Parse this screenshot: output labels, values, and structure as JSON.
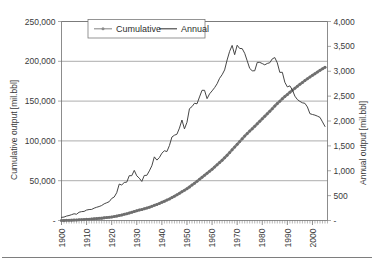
{
  "chart_data": {
    "type": "line",
    "title": "",
    "xlabel": "",
    "ylabel": "Cumulative output [mil.bbl]",
    "y2label": "Annual output [mil.bbl]",
    "xlim": [
      1900,
      2006
    ],
    "ylim": [
      0,
      250000
    ],
    "y2lim": [
      0,
      4000
    ],
    "grid": "horizontal",
    "legend_position": "top-left-inside",
    "x_tick_labels": [
      "1900",
      "1910",
      "1920",
      "1930",
      "1940",
      "1950",
      "1960",
      "1970",
      "1980",
      "1990",
      "2000"
    ],
    "x_ticks": [
      1900,
      1910,
      1920,
      1930,
      1940,
      1950,
      1960,
      1970,
      1980,
      1990,
      2000
    ],
    "x_minor_tick_interval": 1,
    "y_tick_labels": [
      "-",
      "50,000",
      "100,000",
      "150,000",
      "200,000",
      "250,000"
    ],
    "y_ticks": [
      0,
      50000,
      100000,
      150000,
      200000,
      250000
    ],
    "y2_tick_labels": [
      "-",
      "500",
      "1,000",
      "1,500",
      "2,000",
      "2,500",
      "3,000",
      "3,500",
      "4,000"
    ],
    "y2_ticks": [
      0,
      500,
      1000,
      1500,
      2000,
      2500,
      3000,
      3500,
      4000
    ],
    "x": [
      1900,
      1901,
      1902,
      1903,
      1904,
      1905,
      1906,
      1907,
      1908,
      1909,
      1910,
      1911,
      1912,
      1913,
      1914,
      1915,
      1916,
      1917,
      1918,
      1919,
      1920,
      1921,
      1922,
      1923,
      1924,
      1925,
      1926,
      1927,
      1928,
      1929,
      1930,
      1931,
      1932,
      1933,
      1934,
      1935,
      1936,
      1937,
      1938,
      1939,
      1940,
      1941,
      1942,
      1943,
      1944,
      1945,
      1946,
      1947,
      1948,
      1949,
      1950,
      1951,
      1952,
      1953,
      1954,
      1955,
      1956,
      1957,
      1958,
      1959,
      1960,
      1961,
      1962,
      1963,
      1964,
      1965,
      1966,
      1967,
      1968,
      1969,
      1970,
      1971,
      1972,
      1973,
      1974,
      1975,
      1976,
      1977,
      1978,
      1979,
      1980,
      1981,
      1982,
      1983,
      1984,
      1985,
      1986,
      1987,
      1988,
      1989,
      1990,
      1991,
      1992,
      1993,
      1994,
      1995,
      1996,
      1997,
      1998,
      1999,
      2000,
      2001,
      2002,
      2003,
      2004,
      2005
    ],
    "series": [
      {
        "name": "Annual",
        "axis": "right",
        "units": "mil.bbl",
        "color": "#3c3c3c",
        "marker": "none",
        "values": [
          63,
          69,
          89,
          100,
          117,
          135,
          126,
          166,
          178,
          183,
          210,
          220,
          223,
          248,
          266,
          281,
          301,
          335,
          356,
          378,
          443,
          472,
          558,
          732,
          714,
          764,
          771,
          901,
          901,
          1007,
          898,
          851,
          785,
          906,
          908,
          997,
          1100,
          1279,
          1214,
          1265,
          1353,
          1402,
          1386,
          1506,
          1678,
          1714,
          1734,
          1857,
          2020,
          1842,
          1974,
          2248,
          2289,
          2357,
          2345,
          2484,
          2617,
          2617,
          2449,
          2545,
          2605,
          2670,
          2748,
          2858,
          2930,
          3027,
          3227,
          3400,
          3519,
          3333,
          3523,
          3458,
          3455,
          3361,
          3210,
          3057,
          3009,
          3009,
          3178,
          3178,
          3155,
          3129,
          3157,
          3171,
          3249,
          3275,
          3168,
          2977,
          2979,
          2779,
          2685,
          2707,
          2625,
          2499,
          2431,
          2394,
          2366,
          2355,
          2282,
          2147,
          2131,
          2118,
          2097,
          2073,
          1983,
          1890
        ]
      },
      {
        "name": "Cumulative",
        "axis": "left",
        "units": "mil.bbl",
        "color": "#8c8c8c",
        "marker": "dot",
        "values": [
          63,
          132,
          221,
          321,
          438,
          573,
          699,
          865,
          1043,
          1226,
          1436,
          1656,
          1879,
          2127,
          2393,
          2674,
          2975,
          3310,
          3666,
          4044,
          4487,
          4959,
          5517,
          6249,
          6963,
          7727,
          8498,
          9399,
          10300,
          11307,
          12205,
          13056,
          13841,
          14747,
          15655,
          16652,
          17752,
          19031,
          20245,
          21510,
          22863,
          24265,
          25651,
          27157,
          28835,
          30549,
          32283,
          34140,
          36160,
          38002,
          39976,
          42224,
          44513,
          46870,
          49215,
          51699,
          54316,
          56933,
          59382,
          61927,
          64532,
          67202,
          69950,
          72808,
          75738,
          78765,
          81992,
          85392,
          88911,
          92244,
          95767,
          99225,
          102680,
          106041,
          109251,
          112308,
          115317,
          118326,
          121504,
          124682,
          127837,
          130966,
          134123,
          137294,
          140543,
          143818,
          146986,
          149963,
          152942,
          155721,
          158406,
          161113,
          163738,
          166237,
          168668,
          171062,
          173428,
          175783,
          178065,
          180212,
          182343,
          184461,
          186558,
          188631,
          190614,
          192504
        ]
      }
    ]
  },
  "legend": {
    "items": [
      {
        "label": "Cumulative",
        "style": "line-with-marker",
        "color": "#8c8c8c"
      },
      {
        "label": "Annual",
        "style": "line",
        "color": "#3c3c3c"
      }
    ]
  },
  "axes": {
    "left_title": "Cumulative output [mil.bbl]",
    "right_title": "Annual output [mil.bbl]"
  }
}
